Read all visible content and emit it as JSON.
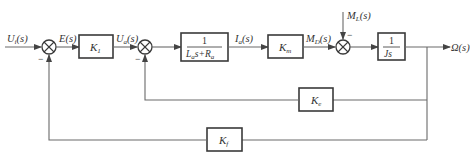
{
  "diagram": {
    "type": "control-block-diagram",
    "signals": {
      "input": {
        "main": "U",
        "sub": "i",
        "arg": "(s)"
      },
      "error": {
        "main": "E",
        "sub": "",
        "arg": "(s)"
      },
      "armature_voltage": {
        "main": "U",
        "sub": "a",
        "arg": "(s)"
      },
      "armature_current": {
        "main": "I",
        "sub": "a",
        "arg": "(s)"
      },
      "motor_torque": {
        "main": "M",
        "sub": "D",
        "arg": "(s)"
      },
      "load_torque": {
        "main": "M",
        "sub": "L",
        "arg": "(s)"
      },
      "output": {
        "main": "Ω",
        "sub": "",
        "arg": "(s)"
      }
    },
    "blocks": {
      "k1": {
        "main": "K",
        "sub": "1"
      },
      "armature": {
        "numerator": "1",
        "den_l": "L",
        "den_l_sub": "a",
        "den_mid": "s+",
        "den_r": "R",
        "den_r_sub": "a"
      },
      "km": {
        "main": "K",
        "sub": "m"
      },
      "inertia": {
        "numerator": "1",
        "denominator": "Js"
      },
      "ke": {
        "main": "K",
        "sub": "e"
      },
      "kf": {
        "main": "K",
        "sub": "f"
      }
    },
    "signs": {
      "sum1_feedback": "−",
      "sum2_feedback": "−",
      "sum3_disturbance": "−"
    }
  }
}
